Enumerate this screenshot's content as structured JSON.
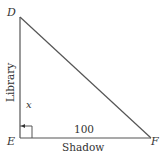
{
  "diagram": {
    "type": "right-triangle",
    "vertices": {
      "top": "D",
      "right_angle": "E",
      "right": "F"
    },
    "side_labels": {
      "vertical_name": "Library",
      "vertical_value": "x",
      "horizontal_value": "100",
      "horizontal_name": "Shadow"
    },
    "colors": {
      "line": "#555555",
      "text": "#333333",
      "background": "#ffffff"
    }
  }
}
